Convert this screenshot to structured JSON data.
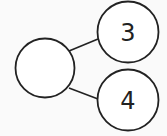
{
  "diagram": {
    "type": "number-bond",
    "whole": {
      "value": ""
    },
    "parts": [
      {
        "value": "3"
      },
      {
        "value": "4"
      }
    ],
    "stroke_color": "#222222",
    "background": "#fafafa"
  }
}
